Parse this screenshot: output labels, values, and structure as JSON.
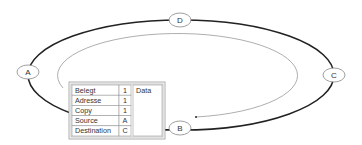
{
  "diagram": {
    "type": "ring-network",
    "nodes": [
      {
        "id": "D",
        "label": "D",
        "position": "top"
      },
      {
        "id": "A",
        "label": "A",
        "position": "left"
      },
      {
        "id": "C",
        "label": "C",
        "position": "right"
      },
      {
        "id": "B",
        "label": "B",
        "position": "bottom"
      }
    ],
    "flow_arrow": {
      "description": "clockwise data path from A over top to B",
      "direction": "clockwise"
    },
    "packet": {
      "fields": [
        {
          "name": "Belegt",
          "value": "1"
        },
        {
          "name": "Adresse",
          "value": "1"
        },
        {
          "name": "Copy",
          "value": "1"
        },
        {
          "name": "Source",
          "value": "A"
        },
        {
          "name": "Destination",
          "value": "C"
        }
      ],
      "data_label": "Data"
    },
    "colors": {
      "ring": "#222222",
      "inner_path": "#999999",
      "node_border": "#888888",
      "table_border": "#999999",
      "text": "#333333"
    }
  }
}
